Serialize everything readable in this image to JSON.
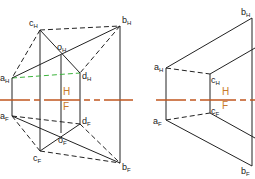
{
  "colors": {
    "line": "#222222",
    "axis": "#c0561e",
    "green": "#3cb43c",
    "axis_label": "#c87a2a"
  },
  "left": {
    "points": {
      "aH": {
        "label": "a",
        "sub": "H"
      },
      "bH": {
        "label": "b",
        "sub": "H"
      },
      "cH": {
        "label": "c",
        "sub": "H"
      },
      "dH": {
        "label": "d",
        "sub": "H"
      },
      "oH": {
        "label": "o",
        "sub": "H"
      },
      "aF": {
        "label": "a",
        "sub": "F"
      },
      "bF": {
        "label": "b",
        "sub": "F"
      },
      "cF": {
        "label": "c",
        "sub": "F"
      },
      "dF": {
        "label": "d",
        "sub": "F"
      },
      "oF": {
        "label": "o",
        "sub": "F"
      }
    },
    "axis": {
      "upper": "H",
      "lower": "F"
    }
  },
  "right": {
    "points": {
      "aH": {
        "label": "a",
        "sub": "H"
      },
      "bH": {
        "label": "b",
        "sub": "H"
      },
      "cH": {
        "label": "c",
        "sub": "H"
      },
      "aF": {
        "label": "a",
        "sub": "F"
      },
      "bF": {
        "label": "b",
        "sub": "F"
      },
      "cF": {
        "label": "c",
        "sub": "F"
      }
    },
    "axis": {
      "upper": "H",
      "lower": "F"
    }
  }
}
